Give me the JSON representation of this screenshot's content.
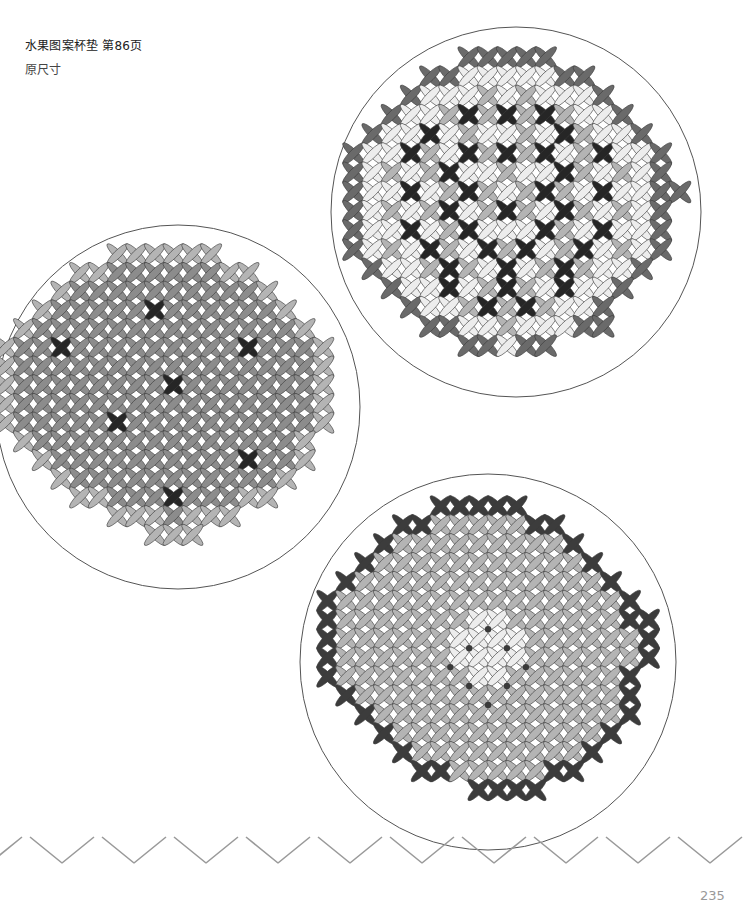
{
  "page": {
    "title": "水果图案杯垫 第86页",
    "subtitle": "原尺寸",
    "page_number": "235"
  },
  "colors": {
    "outline": "#3a3a3a",
    "circle_stroke": "#555555",
    "zigzag": "#9a9a9a",
    "palette": {
      "B": "#6a6a6a",
      "K": "#3c3c3c",
      "D": "#262626",
      "M": "#b4b4b4",
      "G": "#8c8c8c",
      "L": "#ededed",
      "W": "#fafafa"
    }
  },
  "coasters": [
    {
      "name": "top-right-coaster",
      "circle": {
        "cx": 516,
        "cy": 212,
        "r": 185
      },
      "grid": {
        "x": 344,
        "y": 48,
        "cell": 19.2
      },
      "rows": [
        "......BBBBB.......",
        "....BBLLLLLBB.....",
        "...BLLLMLMLLLB....",
        "..BLLMDMDMDMLLB...",
        ".BLLDLMLLMLDMLLB..",
        "BLLDMLDMDMDLMDLLB.",
        "BLMLMDLLMLLDMLMLB.",
        "BLLDLMDMLMDMLDLLBB",
        "BLMLMDLMDMLDMLMLB.",
        "BLLDLMDLLLDMLDLLB.",
        "BLMLDMLDMDLMDLMLB.",
        ".BLLMDMLDLMDMLLB..",
        "..BLLDLMDMLDLLB...",
        "...BLLMDMDMLLB....",
        "....BBLLMLLLBB....",
        "......BBLBB.......",
        "...........  ....."
      ],
      "knots": []
    },
    {
      "name": "left-coaster",
      "circle": {
        "cx": 178,
        "cy": 407,
        "r": 182
      },
      "grid": {
        "x": -4,
        "y": 245,
        "cell": 18.7
      },
      "rows": [
        "......MMMMMM.......",
        "....MMGGGGGGMM.....",
        "...MGGGGGGGGGGM....",
        "..MGGGGGDGGGGGGM...",
        ".MGGGGGGGGGGGGGGM..",
        "MGGDGGGGGGGGGDGGGM.",
        "MGGGGGGGGGGGGGGGGM.",
        "MGGGGGGGGDGGGGGGGM.",
        "MGGGGGGGGGGGGGGGGM.",
        "MGGGGGDGGGGGGGGGGM.",
        ".MGGGGGGGGGGGGGGM..",
        "..MGGGGGGGGGGDGGM..",
        "...MGGGGGGGGGGGM...",
        "....MMGGGDGGGMM....",
        "......MMMGMMM......",
        "........MMM........"
      ],
      "knots": []
    },
    {
      "name": "bottom-coaster",
      "circle": {
        "cx": 488,
        "cy": 662,
        "r": 188
      },
      "grid": {
        "x": 318,
        "y": 497,
        "cell": 18.9
      },
      "rows": [
        "......KKKKK.......",
        "....KKMMMMMKK.....",
        "...KMMMMMMMMMK....",
        "..KMMMMMMMMMMMK...",
        ".KMMMMMMMMMMMMMK..",
        "KMMMMMMMMMMMMMMMK.",
        "KMMMMMMMLLMMMMMMKK",
        "KMMMMMMLLLLMMMMMMK",
        "KMMMMMMLLLLMMMMMMK",
        "KMMMMMMMLLMMMMMMK.",
        ".KMMMMMMMMMMMMMMK.",
        "..KMMMMMMMMMMMMMK.",
        "...KMMMMMMMMMMMK..",
        "....KMMMMMMMMMK...",
        ".....KKMMMMMKK....",
        "........KKKK......",
        "...........  ....."
      ],
      "knots": [
        [
          9,
          7
        ],
        [
          8,
          8
        ],
        [
          10,
          8
        ],
        [
          7,
          9
        ],
        [
          11,
          9
        ],
        [
          8,
          10
        ],
        [
          10,
          10
        ],
        [
          9,
          11
        ]
      ]
    }
  ],
  "zigzag": {
    "period": 72,
    "amplitude": 28,
    "y_top": 840
  }
}
